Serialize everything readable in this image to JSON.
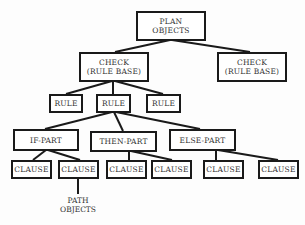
{
  "diagram": {
    "type": "hierarchy-tree",
    "nodes": {
      "root": "PLAN\nOBJECTS",
      "check_left": "CHECK\n(RULE BASE)",
      "check_right": "CHECK\n(RULE BASE)",
      "rule_1": "RULE",
      "rule_2": "RULE",
      "rule_3": "RULE",
      "if_part": "IF-PART",
      "then_part": "THEN-PART",
      "else_part": "ELSE-PART",
      "clause_1": "CLAUSE",
      "clause_2": "CLAUSE",
      "clause_3": "CLAUSE",
      "clause_4": "CLAUSE",
      "clause_5": "CLAUSE",
      "clause_6": "CLAUSE",
      "path_objects": "PATH\nOBJECTS"
    },
    "edges": [
      [
        "root",
        "check_left"
      ],
      [
        "root",
        "check_right"
      ],
      [
        "check_left",
        "rule_1"
      ],
      [
        "check_left",
        "rule_2"
      ],
      [
        "check_left",
        "rule_3"
      ],
      [
        "rule_2",
        "if_part"
      ],
      [
        "rule_2",
        "then_part"
      ],
      [
        "rule_2",
        "else_part"
      ],
      [
        "if_part",
        "clause_1"
      ],
      [
        "if_part",
        "clause_2"
      ],
      [
        "then_part",
        "clause_3"
      ],
      [
        "then_part",
        "clause_4"
      ],
      [
        "else_part",
        "clause_5"
      ],
      [
        "else_part",
        "clause_6"
      ],
      [
        "clause_2",
        "path_objects"
      ]
    ]
  }
}
